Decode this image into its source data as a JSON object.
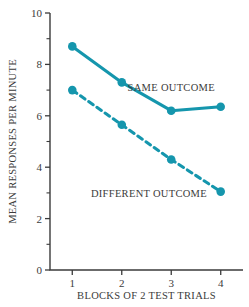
{
  "chart_data": {
    "type": "line",
    "title": "",
    "subtitle": "",
    "xlabel": "BLOCKS OF 2 TEST TRIALS",
    "ylabel": "MEAN RESPONSES PER MINUTE",
    "x": [
      1,
      2,
      3,
      4
    ],
    "categories": [
      "1",
      "2",
      "3",
      "4"
    ],
    "xlim": [
      0.55,
      4.45
    ],
    "ylim": [
      0,
      10
    ],
    "xticks": [
      "1",
      "2",
      "3",
      "4"
    ],
    "yticks": [
      "0",
      "2",
      "4",
      "6",
      "8",
      "10"
    ],
    "y_minor_ticks": [
      1,
      3,
      5,
      7,
      9
    ],
    "grid": false,
    "legend_position": "inline-annotations",
    "series": [
      {
        "name": "SAME OUTCOME",
        "style": "solid",
        "color": "#1596ad",
        "marker": "circle",
        "values": [
          8.7,
          7.3,
          6.2,
          6.35
        ]
      },
      {
        "name": "DIFFERENT OUTCOME",
        "style": "dashed",
        "color": "#1596ad",
        "marker": "circle",
        "values": [
          7.0,
          5.65,
          4.3,
          3.05
        ]
      }
    ],
    "annotations": [
      {
        "text": "SAME OUTCOME",
        "x": 3.0,
        "y": 6.95
      },
      {
        "text": "DIFFERENT OUTCOME",
        "x": 2.55,
        "y": 2.85
      }
    ],
    "colors": {
      "accent": "#1596ad",
      "axis": "#3b3b3b",
      "text": "#3b3b3b",
      "background": "#ffffff"
    }
  }
}
